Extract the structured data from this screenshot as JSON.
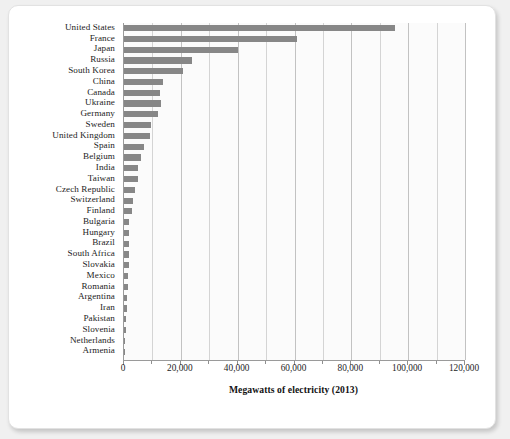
{
  "chart_data": {
    "type": "bar",
    "orientation": "horizontal",
    "title": "",
    "xlabel": "Megawatts of electricity (2013)",
    "ylabel": "",
    "xlim": [
      0,
      120000
    ],
    "xticks": [
      0,
      20000,
      40000,
      60000,
      80000,
      100000,
      120000
    ],
    "xtick_labels": [
      "0",
      "20,000",
      "40,000",
      "60,000",
      "80,000",
      "100,000",
      "120,000"
    ],
    "minor_tick_step": 10000,
    "grid": "vertical",
    "legend": "none",
    "bar_color": "#878787",
    "plot_background": "#fbfbfb",
    "categories": [
      "United States",
      "France",
      "Japan",
      "Russia",
      "South Korea",
      "China",
      "Canada",
      "Ukraine",
      "Germany",
      "Sweden",
      "United Kingdom",
      "Spain",
      "Belgium",
      "India",
      "Taiwan",
      "Czech Republic",
      "Switzerland",
      "Finland",
      "Bulgaria",
      "Hungary",
      "Brazil",
      "South Africa",
      "Slovakia",
      "Mexico",
      "Romania",
      "Argentina",
      "Iran",
      "Pakistan",
      "Slovenia",
      "Netherlands",
      "Armenia"
    ],
    "values": [
      95400,
      60900,
      40100,
      23800,
      20700,
      13800,
      12600,
      13100,
      12000,
      9400,
      9200,
      7100,
      5900,
      4800,
      5000,
      3900,
      3300,
      2700,
      1900,
      1900,
      1900,
      1800,
      1800,
      1400,
      1300,
      1000,
      900,
      700,
      700,
      500,
      400
    ]
  }
}
